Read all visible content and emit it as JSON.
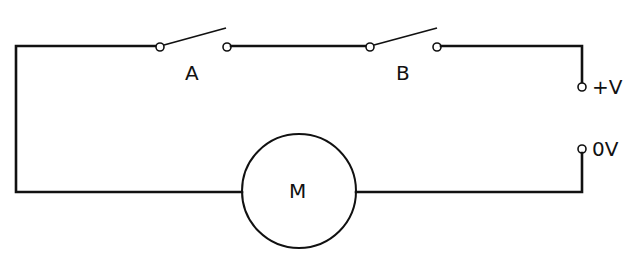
{
  "diagram": {
    "type": "circuit",
    "components": {
      "switch_a": {
        "label": "A",
        "state": "open"
      },
      "switch_b": {
        "label": "B",
        "state": "open"
      },
      "motor": {
        "label": "M"
      }
    },
    "terminals": {
      "positive": {
        "label": "+V"
      },
      "zero": {
        "label": "0V"
      }
    },
    "colors": {
      "line": "#111111",
      "background": "#ffffff"
    }
  }
}
